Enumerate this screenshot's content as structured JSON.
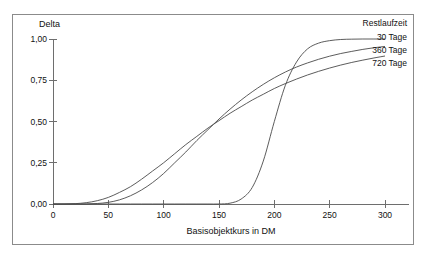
{
  "chart_data": {
    "type": "line",
    "title": "",
    "ylabel": "Delta",
    "xlabel": "Basisobjektkurs in DM",
    "xlim": [
      0,
      300
    ],
    "ylim": [
      0.0,
      1.0
    ],
    "xticks": [
      "0",
      "50",
      "100",
      "150",
      "200",
      "250",
      "300"
    ],
    "xtick_values": [
      0,
      50,
      100,
      150,
      200,
      250,
      300
    ],
    "yticks": [
      "0,00",
      "0,25",
      "0,50",
      "0,75",
      "1,00"
    ],
    "ytick_values": [
      0.0,
      0.25,
      0.5,
      0.75,
      1.0
    ],
    "grid": false,
    "legend_position": "top-right",
    "legend_title": "Restlaufzeit",
    "x": [
      0,
      10,
      20,
      30,
      40,
      50,
      60,
      70,
      80,
      90,
      100,
      110,
      120,
      130,
      140,
      150,
      160,
      170,
      180,
      190,
      200,
      210,
      220,
      230,
      240,
      250,
      260,
      270,
      280,
      290,
      300
    ],
    "series": [
      {
        "name": "30 Tage",
        "values": [
          0.0,
          0.0,
          0.0,
          0.0,
          0.0,
          0.0,
          0.0,
          0.0,
          0.0,
          0.0,
          0.0,
          0.0,
          0.0,
          0.0,
          0.0,
          0.0,
          0.005,
          0.03,
          0.1,
          0.26,
          0.5,
          0.72,
          0.86,
          0.94,
          0.975,
          0.99,
          0.997,
          0.999,
          1.0,
          1.0,
          1.0
        ]
      },
      {
        "name": "360 Tage",
        "values": [
          0.0,
          0.0,
          0.0,
          0.0,
          0.003,
          0.01,
          0.025,
          0.05,
          0.085,
          0.13,
          0.185,
          0.25,
          0.315,
          0.385,
          0.45,
          0.515,
          0.575,
          0.63,
          0.68,
          0.725,
          0.765,
          0.8,
          0.83,
          0.855,
          0.877,
          0.896,
          0.912,
          0.925,
          0.937,
          0.947,
          0.955
        ]
      },
      {
        "name": "720 Tage",
        "values": [
          0.0,
          0.0,
          0.002,
          0.008,
          0.02,
          0.04,
          0.07,
          0.105,
          0.15,
          0.2,
          0.25,
          0.305,
          0.36,
          0.41,
          0.46,
          0.505,
          0.55,
          0.59,
          0.63,
          0.665,
          0.7,
          0.73,
          0.757,
          0.782,
          0.804,
          0.824,
          0.842,
          0.858,
          0.872,
          0.885,
          0.897
        ]
      }
    ]
  },
  "legend": {
    "title": "Restlaufzeit",
    "items": [
      {
        "label": "30 Tage"
      },
      {
        "label": "360 Tage"
      },
      {
        "label": "720 Tage"
      }
    ]
  },
  "axes": {
    "y_title": "Delta",
    "x_title": "Basisobjektkurs in DM"
  },
  "colors": {
    "curve": "#4a4a4a",
    "axis": "#6e6e6e",
    "frame": "#8b8b8b",
    "text": "#111111",
    "background": "#ffffff"
  }
}
